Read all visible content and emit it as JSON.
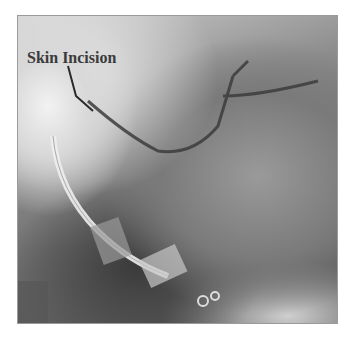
{
  "figure": {
    "annotation": {
      "label": "Skin Incision"
    },
    "colors": {
      "background": "#ffffff",
      "label_text": "#3a3a3a",
      "border": "#9a9a9a"
    }
  }
}
